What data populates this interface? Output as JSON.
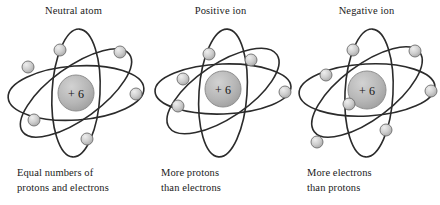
{
  "figure": {
    "background_color": "#ffffff",
    "orbit_color": "#2b2b2b",
    "nucleus_color": "#b3b3b3",
    "nucleus_edge_color": "#8f8f8f",
    "electron_color": "#c3c3c3",
    "electron_edge_color": "#6e6e6e",
    "text_color": "#1a1a1a"
  },
  "panels": [
    {
      "title": "Neutral atom",
      "nucleus_label": "+ 6",
      "caption_line1": "Equal numbers of",
      "caption_line2": "protons and electrons",
      "electron_count": 6,
      "electrons": [
        {
          "cx": 60,
          "cy": 28
        },
        {
          "cx": 28,
          "cy": 45
        },
        {
          "cx": 120,
          "cy": 30
        },
        {
          "cx": 136,
          "cy": 72
        },
        {
          "cx": 34,
          "cy": 98
        },
        {
          "cx": 87,
          "cy": 117
        }
      ]
    },
    {
      "title": "Positive ion",
      "nucleus_label": "+ 6",
      "caption_line1": "More protons",
      "caption_line2": "than electrons",
      "electron_count": 5,
      "electrons": [
        {
          "cx": 62,
          "cy": 32
        },
        {
          "cx": 104,
          "cy": 38
        },
        {
          "cx": 36,
          "cy": 57
        },
        {
          "cx": 138,
          "cy": 70
        },
        {
          "cx": 31,
          "cy": 84
        }
      ]
    },
    {
      "title": "Negative ion",
      "nucleus_label": "+ 6",
      "caption_line1": "More electrons",
      "caption_line2": "than protons",
      "electron_count": 7,
      "electrons": [
        {
          "cx": 60,
          "cy": 28
        },
        {
          "cx": 122,
          "cy": 29
        },
        {
          "cx": 33,
          "cy": 53
        },
        {
          "cx": 138,
          "cy": 69
        },
        {
          "cx": 56,
          "cy": 82
        },
        {
          "cx": 93,
          "cy": 108
        },
        {
          "cx": 24,
          "cy": 120
        }
      ]
    }
  ]
}
